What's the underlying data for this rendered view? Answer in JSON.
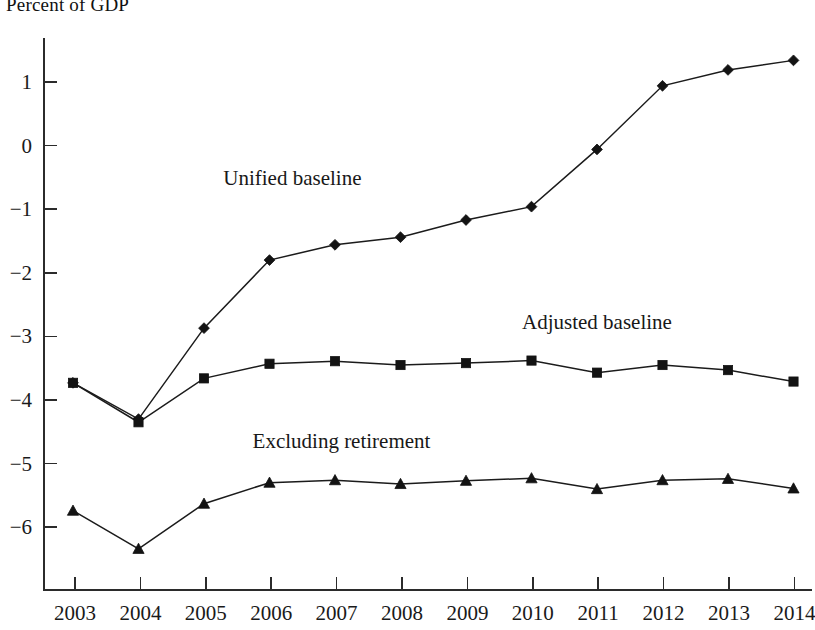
{
  "chart_data": {
    "type": "line",
    "title": "Percent of GDP",
    "xlabel": "",
    "ylabel": "",
    "ylim": [
      -6.8,
      1.7
    ],
    "yticks": [
      1,
      0,
      -1,
      -2,
      -3,
      -4,
      -5,
      -6
    ],
    "ytick_labels": [
      "1",
      "0",
      "−1",
      "−2",
      "−3",
      "−4",
      "−5",
      "−6"
    ],
    "grid": false,
    "legend_position": "inline-annotations",
    "categories": [
      "2003",
      "2004",
      "2005",
      "2006",
      "2007",
      "2008",
      "2009",
      "2010",
      "2011",
      "2012",
      "2013",
      "2014"
    ],
    "x": [
      2003,
      2004,
      2005,
      2006,
      2007,
      2008,
      2009,
      2010,
      2011,
      2012,
      2013,
      2014
    ],
    "series": [
      {
        "name": "Unified baseline",
        "marker": "diamond",
        "values": [
          -3.73,
          -4.3,
          -2.87,
          -1.8,
          -1.56,
          -1.44,
          -1.17,
          -0.96,
          -0.06,
          0.94,
          1.19,
          1.34
        ],
        "label_x": 2006.35,
        "label_y": -0.62
      },
      {
        "name": "Adjusted baseline",
        "marker": "square",
        "values": [
          -3.73,
          -4.35,
          -3.66,
          -3.43,
          -3.39,
          -3.45,
          -3.42,
          -3.38,
          -3.57,
          -3.45,
          -3.53,
          -3.71
        ],
        "label_x": 2011.0,
        "label_y": -2.88
      },
      {
        "name": "Excluding retirement",
        "marker": "triangle",
        "values": [
          -5.74,
          -6.34,
          -5.63,
          -5.3,
          -5.26,
          -5.32,
          -5.27,
          -5.23,
          -5.4,
          -5.26,
          -5.24,
          -5.39
        ],
        "label_x": 2007.1,
        "label_y": -4.75
      }
    ],
    "colors": {
      "line": "#1b1b1b",
      "marker": "#131313",
      "axis": "#2b2b2b",
      "text": "#1a1a1a",
      "background": "#ffffff"
    }
  }
}
